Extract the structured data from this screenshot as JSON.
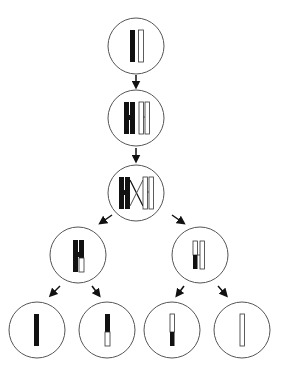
{
  "diagram": {
    "type": "meiosis-crossing-over",
    "colors": {
      "stroke": "#333333",
      "dark": "#111111",
      "light": "#ffffff"
    },
    "stages": [
      {
        "id": "parent-cell",
        "label": "homologous pair (one dark, one light chromosome)"
      },
      {
        "id": "replicated-cell",
        "label": "replicated chromosomes (sister chromatids)"
      },
      {
        "id": "crossing-over-cell",
        "label": "crossing over between non-sister chromatids"
      },
      {
        "id": "daughter-cell-left",
        "label": "dark chromosome with light segment"
      },
      {
        "id": "daughter-cell-right",
        "label": "light chromosome with dark segment"
      },
      {
        "id": "gamete-1",
        "label": "all dark chromatid"
      },
      {
        "id": "gamete-2",
        "label": "dark chromatid with light bottom segment"
      },
      {
        "id": "gamete-3",
        "label": "light chromatid with dark bottom segment"
      },
      {
        "id": "gamete-4",
        "label": "all light chromatid"
      }
    ]
  }
}
